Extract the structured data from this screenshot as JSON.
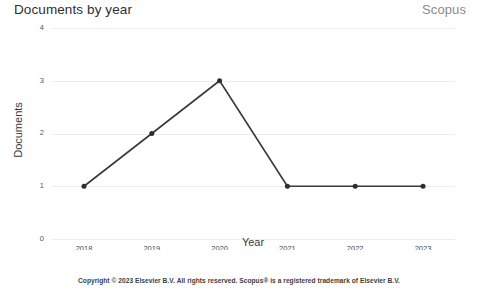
{
  "header": {
    "title": "Documents by year",
    "brand": "Scopus"
  },
  "footer": {
    "copyright": "Copyright © 2023 Elsevier B.V. All rights reserved. Scopus® is a registered trademark of Elsevier B.V."
  },
  "axes": {
    "x_title": "Year",
    "y_title": "Documents"
  },
  "colors": {
    "line": "#3a3a3a",
    "marker": "#2e2e2e",
    "grid": "#ededed",
    "title": "#2f2f2f",
    "brand": "#8b8b8b"
  },
  "chart_data": {
    "type": "line",
    "title": "Documents by year",
    "xlabel": "Year",
    "ylabel": "Documents",
    "categories": [
      "2018",
      "2019",
      "2020",
      "2021",
      "2022",
      "2023"
    ],
    "values": [
      1,
      2,
      3,
      1,
      1,
      1
    ],
    "x": [
      2018,
      2019,
      2020,
      2021,
      2022,
      2023
    ],
    "ylim": [
      0,
      4
    ],
    "yticks": [
      0,
      1,
      2,
      3,
      4
    ],
    "ytick_labels": [
      "0",
      "1",
      "2",
      "3",
      "4"
    ],
    "xtick_labels": [
      "2018",
      "2019",
      "2020",
      "2021",
      "2022",
      "2023"
    ],
    "grid": true,
    "grid_axis": "y",
    "legend": false,
    "markers": true,
    "series": [
      {
        "name": "Documents",
        "values": [
          1,
          2,
          3,
          1,
          1,
          1
        ]
      }
    ]
  }
}
